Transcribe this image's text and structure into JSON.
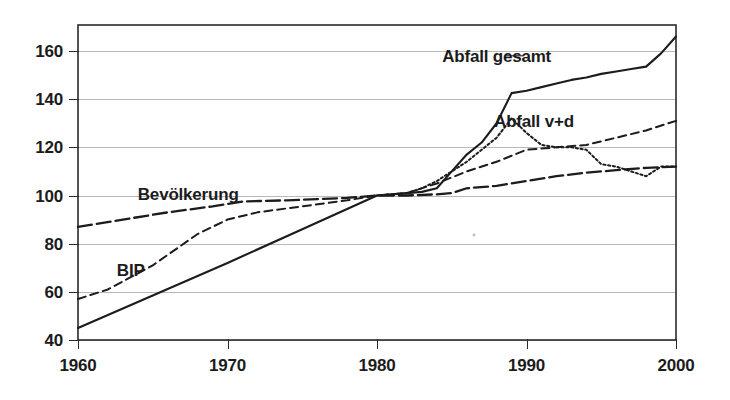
{
  "chart_data": {
    "type": "line",
    "title": "",
    "subtitle": "",
    "xlabel": "",
    "ylabel": "",
    "xlim": [
      1960,
      2000
    ],
    "ylim": [
      40,
      168
    ],
    "grid": true,
    "grid_axis": "y",
    "legend": "inline-labels",
    "index_base": {
      "year": 1980,
      "value": 100
    },
    "x_ticks": [
      1960,
      1970,
      1980,
      1990,
      2000
    ],
    "x_tick_labels": [
      "1960",
      "1970",
      "1980",
      "1990",
      "2000"
    ],
    "y_ticks": [
      40,
      60,
      80,
      100,
      120,
      140,
      160
    ],
    "y_tick_labels": [
      "40",
      "60",
      "80",
      "100",
      "120",
      "140",
      "160"
    ],
    "series": [
      {
        "name": "Abfall gesamt",
        "style": "solid",
        "label_x": 1988.0,
        "label_y": 158.0,
        "x": [
          1960,
          1965,
          1970,
          1975,
          1980,
          1982,
          1983,
          1984,
          1985,
          1986,
          1987,
          1988,
          1989,
          1990,
          1991,
          1992,
          1993,
          1994,
          1995,
          1996,
          1997,
          1998,
          1999,
          2000
        ],
        "values": [
          45,
          58.5,
          72,
          86,
          100,
          101,
          101.5,
          103,
          110,
          117,
          122,
          130,
          142.5,
          143.5,
          145,
          146.5,
          148,
          149,
          150.5,
          151.5,
          152.5,
          153.5,
          159,
          166
        ]
      },
      {
        "name": "Abfall v+d",
        "style": "dotted",
        "label_x": 1990.5,
        "label_y": 131.0,
        "x": [
          1960,
          1970,
          1975,
          1980,
          1982,
          1983,
          1984,
          1985,
          1986,
          1987,
          1988,
          1989,
          1990,
          1991,
          1992,
          1993,
          1994,
          1995,
          1996,
          1997,
          1998,
          1999,
          2000
        ],
        "values": [
          null,
          null,
          null,
          100,
          101,
          103,
          106,
          110,
          114,
          119,
          124,
          132,
          126,
          121,
          120,
          120,
          119,
          113,
          112,
          110,
          108,
          112,
          112
        ]
      },
      {
        "name": "BIP",
        "style": "dashed",
        "label_x": 1962.6,
        "label_y": 69.0,
        "x": [
          1960,
          1962,
          1965,
          1968,
          1970,
          1972,
          1975,
          1978,
          1980,
          1982,
          1984,
          1986,
          1988,
          1990,
          1992,
          1994,
          1996,
          1998,
          2000
        ],
        "values": [
          57,
          61,
          71,
          84,
          90,
          93,
          95.5,
          98,
          100,
          101,
          105,
          110,
          114,
          119,
          120,
          121,
          124,
          127,
          131
        ]
      },
      {
        "name": "Bevölkerung",
        "style": "dashdot",
        "label_x": 1964.0,
        "label_y": 100.5,
        "x": [
          1960,
          1963,
          1966,
          1969,
          1971,
          1974,
          1976,
          1978,
          1980,
          1982,
          1984,
          1985,
          1986,
          1988,
          1990,
          1992,
          1994,
          1996,
          1998,
          2000
        ],
        "values": [
          87,
          90,
          93,
          95.5,
          97.5,
          98,
          98.5,
          99,
          100,
          100,
          100.5,
          101,
          103,
          104,
          106,
          108,
          109.5,
          110.5,
          111.5,
          112
        ]
      }
    ],
    "colors": {
      "line": "#1c1c1c",
      "grid": "#b9b9b9",
      "frame": "#2a2a2a",
      "background": "#ffffff",
      "text": "#1c1c1c"
    }
  }
}
